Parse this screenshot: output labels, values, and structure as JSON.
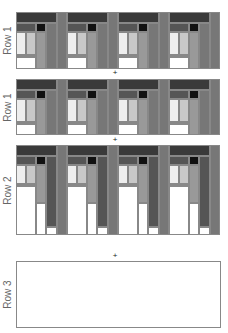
{
  "rows": [
    {
      "label": "Row 1",
      "top": 12,
      "height": 57,
      "kind": "short"
    },
    {
      "label": "Row 1",
      "top": 79,
      "height": 56,
      "kind": "short"
    },
    {
      "label": "Row 2",
      "top": 145,
      "height": 90,
      "kind": "tall"
    },
    {
      "label": "Row 3",
      "top": 261,
      "height": 67,
      "kind": "empty"
    }
  ],
  "separators": [
    {
      "symbol": "+",
      "top": 70
    },
    {
      "symbol": "+",
      "top": 137
    },
    {
      "symbol": "+",
      "top": 253
    }
  ],
  "colors": {
    "darkest": "#111111",
    "dark": "#3a3a3a",
    "dark_mid": "#555555",
    "mid": "#777777",
    "mid_light": "#999999",
    "light": "#c8c8c8",
    "lightest": "#eeeeee",
    "white": "#ffffff",
    "border": "#888888"
  },
  "blocks_per_row": 4
}
